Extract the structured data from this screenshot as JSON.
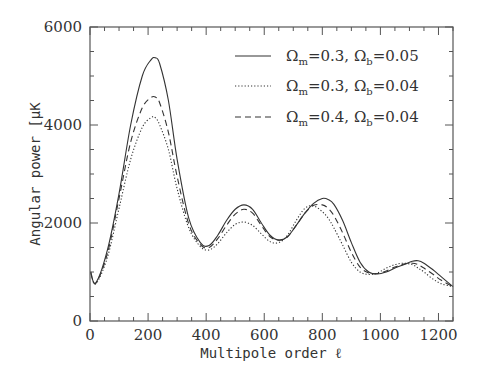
{
  "chart_data": {
    "type": "line",
    "title": "",
    "xlabel": "Multipole order ℓ",
    "ylabel": "Angular power [μK",
    "xlim": [
      0,
      1250
    ],
    "ylim": [
      0,
      6000
    ],
    "xticks": [
      0,
      200,
      400,
      600,
      800,
      1000,
      1200
    ],
    "yticks": [
      0,
      2000,
      4000,
      6000
    ],
    "grid": false,
    "legend_position": "upper right",
    "x": [
      2,
      20,
      60,
      100,
      140,
      180,
      210,
      225,
      240,
      270,
      300,
      340,
      380,
      410,
      440,
      470,
      500,
      530,
      560,
      590,
      620,
      650,
      680,
      710,
      740,
      770,
      800,
      820,
      840,
      870,
      900,
      930,
      960,
      990,
      1020,
      1050,
      1080,
      1110,
      1130,
      1150,
      1180,
      1210,
      1250
    ],
    "series": [
      {
        "name": "Ωm=0.3, Ωb=0.05",
        "style": "solid",
        "values": [
          1000,
          780,
          1450,
          2600,
          4000,
          5000,
          5330,
          5370,
          5250,
          4500,
          3300,
          2100,
          1600,
          1540,
          1750,
          2050,
          2280,
          2370,
          2280,
          2000,
          1750,
          1650,
          1720,
          1950,
          2200,
          2400,
          2500,
          2480,
          2380,
          2050,
          1600,
          1200,
          1000,
          960,
          1000,
          1080,
          1150,
          1220,
          1230,
          1180,
          1050,
          900,
          700
        ]
      },
      {
        "name": "Ωm=0.3, Ωb=0.04",
        "style": "dotted",
        "values": [
          1000,
          760,
          1300,
          2300,
          3300,
          3950,
          4150,
          4150,
          4000,
          3500,
          2700,
          1900,
          1520,
          1450,
          1580,
          1800,
          1970,
          2020,
          1950,
          1780,
          1620,
          1600,
          1750,
          2050,
          2300,
          2350,
          2230,
          2100,
          1900,
          1550,
          1200,
          1000,
          950,
          980,
          1080,
          1150,
          1180,
          1150,
          1080,
          1000,
          860,
          760,
          700
        ]
      },
      {
        "name": "Ωm=0.4, Ωb=0.04",
        "style": "dashed",
        "values": [
          1000,
          770,
          1380,
          2500,
          3650,
          4350,
          4560,
          4570,
          4450,
          3850,
          2950,
          1980,
          1560,
          1500,
          1680,
          1950,
          2180,
          2280,
          2200,
          1950,
          1720,
          1650,
          1720,
          1950,
          2200,
          2360,
          2370,
          2300,
          2150,
          1800,
          1400,
          1100,
          980,
          970,
          1020,
          1100,
          1160,
          1180,
          1150,
          1080,
          960,
          830,
          700
        ]
      }
    ]
  },
  "legend": {
    "items": [
      {
        "om": "0.3",
        "ob": "0.05",
        "style": "solid"
      },
      {
        "om": "0.3",
        "ob": "0.04",
        "style": "dotted"
      },
      {
        "om": "0.4",
        "ob": "0.04",
        "style": "dashed"
      }
    ]
  },
  "axes": {
    "x_tick_labels": [
      "0",
      "200",
      "400",
      "600",
      "800",
      "1000",
      "1200"
    ],
    "y_tick_labels": [
      "0",
      "2000",
      "4000",
      "6000"
    ],
    "xlabel": "Multipole order ℓ",
    "ylabel": "Angular power [μK"
  }
}
